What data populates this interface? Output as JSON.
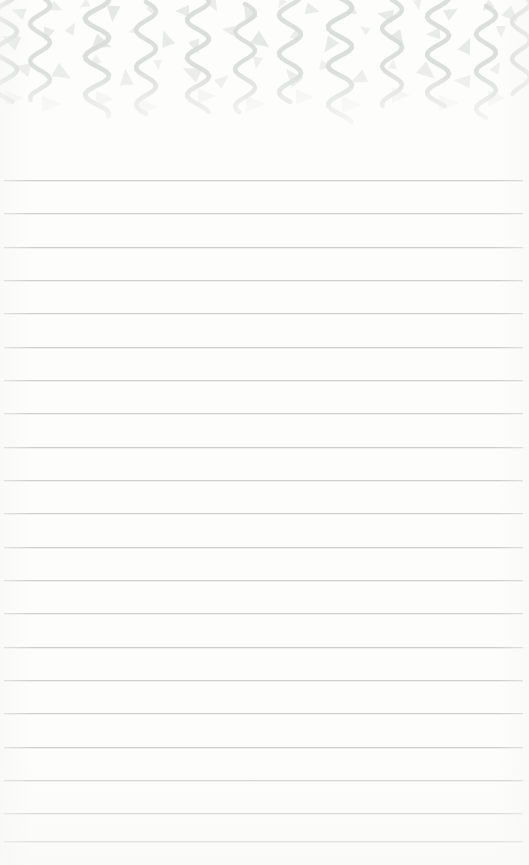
{
  "document": {
    "kind": "lined-notepad-page",
    "title": "",
    "background_color": "#fdfdfc",
    "width": 529,
    "height": 865,
    "body_text": ""
  },
  "header_decoration": {
    "name": "confetti-streamer-border",
    "description": "Celebratory confetti border: vertical serpentine streamers and scattered triangle confetti",
    "color": "#d9dcd9",
    "color_light": "#e6e8e6",
    "band_height": 135,
    "fade_start": 70,
    "fade_end": 128,
    "streamers": [
      {
        "x": 6,
        "y": -16,
        "len": 118,
        "amp": 11,
        "periods": 3.1,
        "w": 4.6,
        "op": 0.95
      },
      {
        "x": 40,
        "y": -4,
        "len": 104,
        "amp": 10,
        "periods": 2.8,
        "w": 4.4,
        "op": 0.92
      },
      {
        "x": 97,
        "y": -10,
        "len": 126,
        "amp": 12,
        "periods": 3.3,
        "w": 4.8,
        "op": 0.95
      },
      {
        "x": 146,
        "y": 2,
        "len": 112,
        "amp": 10,
        "periods": 3.0,
        "w": 4.5,
        "op": 0.9
      },
      {
        "x": 198,
        "y": -8,
        "len": 120,
        "amp": 11,
        "periods": 3.2,
        "w": 4.6,
        "op": 0.93
      },
      {
        "x": 245,
        "y": 4,
        "len": 108,
        "amp": 10,
        "periods": 2.9,
        "w": 4.4,
        "op": 0.9
      },
      {
        "x": 290,
        "y": -14,
        "len": 116,
        "amp": 11,
        "periods": 3.0,
        "w": 4.6,
        "op": 0.92
      },
      {
        "x": 340,
        "y": -2,
        "len": 124,
        "amp": 12,
        "periods": 3.2,
        "w": 4.7,
        "op": 0.94
      },
      {
        "x": 392,
        "y": 0,
        "len": 106,
        "amp": 10,
        "periods": 2.8,
        "w": 4.4,
        "op": 0.9
      },
      {
        "x": 438,
        "y": -12,
        "len": 118,
        "amp": 11,
        "periods": 3.1,
        "w": 4.6,
        "op": 0.93
      },
      {
        "x": 486,
        "y": 6,
        "len": 112,
        "amp": 10,
        "periods": 3.0,
        "w": 4.5,
        "op": 0.92
      },
      {
        "x": 521,
        "y": -6,
        "len": 100,
        "amp": 9,
        "periods": 2.7,
        "w": 4.3,
        "op": 0.88
      }
    ],
    "triangles": [
      {
        "x": 18,
        "y": 12,
        "s": 7,
        "r": 200,
        "op": 0.55
      },
      {
        "x": 57,
        "y": 8,
        "s": 6,
        "r": 25,
        "op": 0.5
      },
      {
        "x": 84,
        "y": 5,
        "s": 5,
        "r": 150,
        "op": 0.45
      },
      {
        "x": 113,
        "y": 14,
        "s": 8,
        "r": 95,
        "op": 0.62
      },
      {
        "x": 152,
        "y": 7,
        "s": 5,
        "r": 310,
        "op": 0.45
      },
      {
        "x": 182,
        "y": 11,
        "s": 7,
        "r": 180,
        "op": 0.55
      },
      {
        "x": 214,
        "y": 6,
        "s": 6,
        "r": 60,
        "op": 0.5
      },
      {
        "x": 248,
        "y": 13,
        "s": 8,
        "r": 240,
        "op": 0.6
      },
      {
        "x": 281,
        "y": 4,
        "s": 5,
        "r": 120,
        "op": 0.42
      },
      {
        "x": 313,
        "y": 10,
        "s": 7,
        "r": 15,
        "op": 0.55
      },
      {
        "x": 352,
        "y": 8,
        "s": 6,
        "r": 270,
        "op": 0.5
      },
      {
        "x": 385,
        "y": 15,
        "s": 8,
        "r": 190,
        "op": 0.6
      },
      {
        "x": 418,
        "y": 5,
        "s": 5,
        "r": 80,
        "op": 0.45
      },
      {
        "x": 452,
        "y": 12,
        "s": 7,
        "r": 330,
        "op": 0.55
      },
      {
        "x": 487,
        "y": 7,
        "s": 6,
        "r": 140,
        "op": 0.5
      },
      {
        "x": 512,
        "y": 16,
        "s": 8,
        "r": 45,
        "op": 0.58
      },
      {
        "x": 10,
        "y": 40,
        "s": 9,
        "r": 205,
        "op": 0.62
      },
      {
        "x": 47,
        "y": 35,
        "s": 7,
        "r": 110,
        "op": 0.55
      },
      {
        "x": 72,
        "y": 28,
        "s": 6,
        "r": 300,
        "op": 0.48
      },
      {
        "x": 103,
        "y": 44,
        "s": 9,
        "r": 20,
        "op": 0.62
      },
      {
        "x": 133,
        "y": 31,
        "s": 5,
        "r": 165,
        "op": 0.42
      },
      {
        "x": 166,
        "y": 38,
        "s": 8,
        "r": 250,
        "op": 0.58
      },
      {
        "x": 196,
        "y": 47,
        "s": 7,
        "r": 70,
        "op": 0.55
      },
      {
        "x": 228,
        "y": 30,
        "s": 6,
        "r": 190,
        "op": 0.48
      },
      {
        "x": 262,
        "y": 42,
        "s": 9,
        "r": 35,
        "op": 0.62
      },
      {
        "x": 296,
        "y": 33,
        "s": 6,
        "r": 285,
        "op": 0.48
      },
      {
        "x": 329,
        "y": 46,
        "s": 8,
        "r": 125,
        "op": 0.58
      },
      {
        "x": 364,
        "y": 29,
        "s": 5,
        "r": 215,
        "op": 0.42
      },
      {
        "x": 399,
        "y": 41,
        "s": 9,
        "r": 55,
        "op": 0.6
      },
      {
        "x": 433,
        "y": 34,
        "s": 7,
        "r": 175,
        "op": 0.55
      },
      {
        "x": 467,
        "y": 45,
        "s": 8,
        "r": 295,
        "op": 0.58
      },
      {
        "x": 501,
        "y": 32,
        "s": 6,
        "r": 90,
        "op": 0.48
      },
      {
        "x": 22,
        "y": 68,
        "s": 8,
        "r": 195,
        "op": 0.5
      },
      {
        "x": 63,
        "y": 74,
        "s": 9,
        "r": 30,
        "op": 0.52
      },
      {
        "x": 94,
        "y": 62,
        "s": 6,
        "r": 145,
        "op": 0.4
      },
      {
        "x": 126,
        "y": 77,
        "s": 8,
        "r": 265,
        "op": 0.5
      },
      {
        "x": 158,
        "y": 65,
        "s": 5,
        "r": 85,
        "op": 0.36
      },
      {
        "x": 191,
        "y": 72,
        "s": 9,
        "r": 205,
        "op": 0.5
      },
      {
        "x": 223,
        "y": 80,
        "s": 7,
        "r": 320,
        "op": 0.46
      },
      {
        "x": 257,
        "y": 63,
        "s": 6,
        "r": 100,
        "op": 0.4
      },
      {
        "x": 292,
        "y": 76,
        "s": 9,
        "r": 230,
        "op": 0.5
      },
      {
        "x": 326,
        "y": 66,
        "s": 6,
        "r": 10,
        "op": 0.4
      },
      {
        "x": 358,
        "y": 79,
        "s": 8,
        "r": 155,
        "op": 0.48
      },
      {
        "x": 393,
        "y": 64,
        "s": 5,
        "r": 275,
        "op": 0.36
      },
      {
        "x": 428,
        "y": 73,
        "s": 9,
        "r": 40,
        "op": 0.5
      },
      {
        "x": 462,
        "y": 81,
        "s": 8,
        "r": 185,
        "op": 0.48
      },
      {
        "x": 497,
        "y": 67,
        "s": 6,
        "r": 300,
        "op": 0.4
      },
      {
        "x": 14,
        "y": 98,
        "s": 9,
        "r": 0,
        "op": 0.34
      },
      {
        "x": 52,
        "y": 104,
        "s": 10,
        "r": 0,
        "op": 0.3
      },
      {
        "x": 105,
        "y": 99,
        "s": 9,
        "r": 0,
        "op": 0.32
      },
      {
        "x": 148,
        "y": 107,
        "s": 10,
        "r": 0,
        "op": 0.28
      },
      {
        "x": 207,
        "y": 96,
        "s": 9,
        "r": 0,
        "op": 0.32
      },
      {
        "x": 256,
        "y": 104,
        "s": 10,
        "r": 0,
        "op": 0.28
      },
      {
        "x": 305,
        "y": 97,
        "s": 9,
        "r": 0,
        "op": 0.3
      },
      {
        "x": 352,
        "y": 105,
        "s": 10,
        "r": 0,
        "op": 0.26
      },
      {
        "x": 401,
        "y": 95,
        "s": 9,
        "r": 0,
        "op": 0.3
      },
      {
        "x": 449,
        "y": 103,
        "s": 10,
        "r": 0,
        "op": 0.26
      },
      {
        "x": 497,
        "y": 98,
        "s": 9,
        "r": 0,
        "op": 0.28
      }
    ]
  },
  "ruled_area": {
    "name": "writing-lines",
    "line_color": "#c9cdc9",
    "left": 4,
    "right": 523,
    "first_line_y": 180,
    "spacing": 33.3,
    "line_count": 21,
    "lines": [
      {
        "y": 180,
        "text": ""
      },
      {
        "y": 213,
        "text": ""
      },
      {
        "y": 247,
        "text": ""
      },
      {
        "y": 280,
        "text": ""
      },
      {
        "y": 313,
        "text": ""
      },
      {
        "y": 347,
        "text": ""
      },
      {
        "y": 380,
        "text": ""
      },
      {
        "y": 413,
        "text": ""
      },
      {
        "y": 447,
        "text": ""
      },
      {
        "y": 480,
        "text": ""
      },
      {
        "y": 513,
        "text": ""
      },
      {
        "y": 547,
        "text": ""
      },
      {
        "y": 580,
        "text": ""
      },
      {
        "y": 613,
        "text": ""
      },
      {
        "y": 647,
        "text": ""
      },
      {
        "y": 680,
        "text": ""
      },
      {
        "y": 713,
        "text": ""
      },
      {
        "y": 747,
        "text": ""
      },
      {
        "y": 780,
        "text": ""
      },
      {
        "y": 813,
        "text": ""
      },
      {
        "y": 841,
        "text": ""
      }
    ]
  }
}
